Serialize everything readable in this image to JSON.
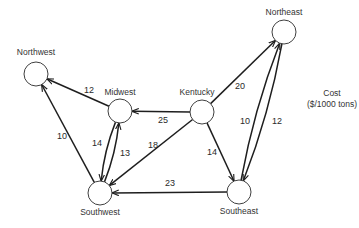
{
  "diagram": {
    "type": "directed-network",
    "legend": {
      "line1": "Cost",
      "line2": "($/1000 tons)"
    },
    "nodes": [
      {
        "id": "northwest",
        "label": "Northwest"
      },
      {
        "id": "midwest",
        "label": "Midwest"
      },
      {
        "id": "kentucky",
        "label": "Kentucky"
      },
      {
        "id": "northeast",
        "label": "Northeast"
      },
      {
        "id": "southwest",
        "label": "Southwest"
      },
      {
        "id": "southeast",
        "label": "Southeast"
      }
    ],
    "edges": [
      {
        "from": "midwest",
        "to": "northwest",
        "cost": "12"
      },
      {
        "from": "kentucky",
        "to": "midwest",
        "cost": "25"
      },
      {
        "from": "kentucky",
        "to": "northeast",
        "cost": "20"
      },
      {
        "from": "kentucky",
        "to": "southwest",
        "cost": "18"
      },
      {
        "from": "kentucky",
        "to": "southeast",
        "cost": "14"
      },
      {
        "from": "midwest",
        "to": "southwest",
        "cost": "14"
      },
      {
        "from": "southwest",
        "to": "midwest",
        "cost": "13"
      },
      {
        "from": "southwest",
        "to": "northwest",
        "cost": "10"
      },
      {
        "from": "southeast",
        "to": "southwest",
        "cost": "23"
      },
      {
        "from": "southeast",
        "to": "northeast",
        "cost": "10"
      },
      {
        "from": "northeast",
        "to": "southeast",
        "cost": "12"
      }
    ]
  }
}
